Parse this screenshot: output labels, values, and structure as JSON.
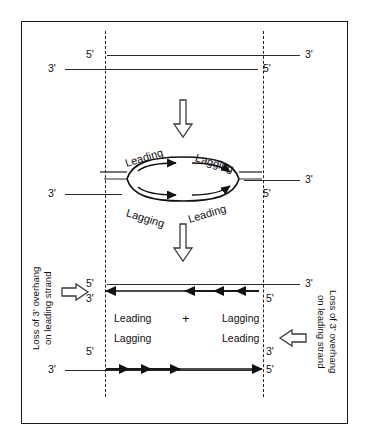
{
  "figure": {
    "border_color": "#1a1a1a",
    "line_color": "#2b2b2b"
  },
  "stage1": {
    "name": "parental-duplex",
    "top_strand": {
      "left_label": "5'",
      "right_label": "3'"
    },
    "bottom_strand": {
      "left_label": "3'",
      "right_label": "5'"
    }
  },
  "stage2": {
    "name": "replication-bubble",
    "top_strand": {
      "right_label": "3'"
    },
    "bottom_strand": {
      "left_label": "3'",
      "right_label": "5'"
    },
    "bubble_labels": {
      "top_left": "Leading",
      "top_right": "Lagging",
      "bottom_left": "Lagging",
      "bottom_right": "Leading"
    }
  },
  "stage3": {
    "name": "daughter-duplexes",
    "plus_sign": "+",
    "duplex_a": {
      "top_strand": {
        "left_label": "5'",
        "right_label": "3'"
      },
      "bottom_strand": {
        "left_label": "3'",
        "right_label": "5'"
      },
      "segment_labels": {
        "left": "Leading",
        "right": "Lagging"
      }
    },
    "duplex_b": {
      "top_strand": {
        "left_label": "5'",
        "right_label": "3'"
      },
      "bottom_strand": {
        "left_label": "3'",
        "right_label": "5'"
      },
      "segment_labels": {
        "left": "Lagging",
        "right": "Leading"
      }
    },
    "annotation_left": "Loss of 3' overhang\non leading strand",
    "annotation_left_line1": "Loss of 3' overhang",
    "annotation_left_line2": "on leading strand",
    "annotation_right_line1": "Loss of 3' overhang",
    "annotation_right_line2": "on leading strand"
  },
  "icons": {
    "down_arrow_1": "down-arrow-icon",
    "down_arrow_2": "down-arrow-icon",
    "right_arrow": "right-arrow-icon",
    "left_arrow": "left-arrow-icon"
  }
}
